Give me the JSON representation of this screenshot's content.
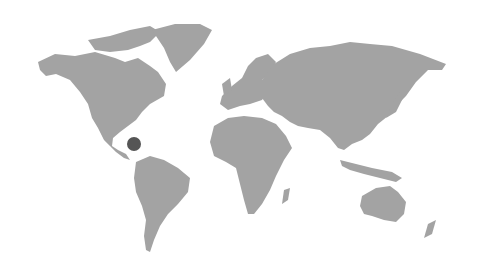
{
  "map": {
    "type": "world-map",
    "land_color": "#a3a3a3",
    "background_color": "#ffffff",
    "markers": [
      {
        "name": "caribbean-marker",
        "region": "Central America / Caribbean",
        "x": 134,
        "y": 144,
        "r": 7,
        "color": "#555555"
      }
    ]
  }
}
